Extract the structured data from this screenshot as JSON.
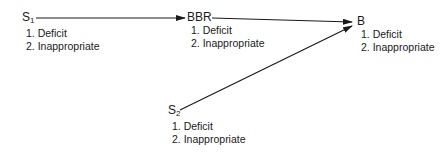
{
  "diagram": {
    "nodes": [
      {
        "id": "S1",
        "label": "S",
        "subscript": "1",
        "items": [
          "1. Deficit",
          "2. Inappropriate"
        ]
      },
      {
        "id": "BBR",
        "label": "BBR",
        "subscript": "",
        "items": [
          "1. Deficit",
          "2. Inappropriate"
        ]
      },
      {
        "id": "B",
        "label": "B",
        "subscript": "",
        "items": [
          "1. Deficit",
          "2. Inappropriate"
        ]
      },
      {
        "id": "S2",
        "label": "S",
        "subscript": "2",
        "items": [
          "1. Deficit",
          "2. Inappropriate"
        ]
      }
    ],
    "edges": [
      {
        "from": "S1",
        "to": "BBR",
        "arrow": true
      },
      {
        "from": "BBR",
        "to": "B",
        "arrow": true
      },
      {
        "from": "S2",
        "to": "B",
        "arrow": true
      }
    ],
    "colors": {
      "line": "#1a1a1a",
      "text": "#1a1a1a",
      "background": "#ffffff"
    }
  }
}
